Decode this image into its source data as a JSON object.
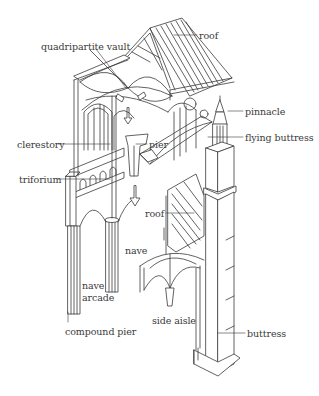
{
  "diagram": {
    "colors": {
      "ink": "#3a3a3a",
      "background": "#ffffff"
    },
    "labels": [
      {
        "id": "roof-top",
        "text": "roof",
        "x": 199,
        "y": 31
      },
      {
        "id": "quadripartite-vault",
        "text": "quadripartite vault",
        "x": 41,
        "y": 42
      },
      {
        "id": "pinnacle",
        "text": "pinnacle",
        "x": 245,
        "y": 107
      },
      {
        "id": "flying-buttress",
        "text": "flying buttress",
        "x": 245,
        "y": 133
      },
      {
        "id": "clerestory",
        "text": "clerestory",
        "x": 17,
        "y": 140
      },
      {
        "id": "pier",
        "text": "pier",
        "x": 149,
        "y": 140
      },
      {
        "id": "triforium",
        "text": "triforium",
        "x": 19,
        "y": 175
      },
      {
        "id": "roof-aisle",
        "text": "roof",
        "x": 145,
        "y": 209
      },
      {
        "id": "nave",
        "text": "nave",
        "x": 125,
        "y": 246
      },
      {
        "id": "nave-arcade-1",
        "text": "nave",
        "x": 82,
        "y": 281
      },
      {
        "id": "nave-arcade-2",
        "text": "arcade",
        "x": 82,
        "y": 293
      },
      {
        "id": "side-aisle",
        "text": "side aisle",
        "x": 152,
        "y": 316
      },
      {
        "id": "compound-pier",
        "text": "compound pier",
        "x": 65,
        "y": 327
      },
      {
        "id": "buttress",
        "text": "buttress",
        "x": 247,
        "y": 329
      }
    ]
  }
}
